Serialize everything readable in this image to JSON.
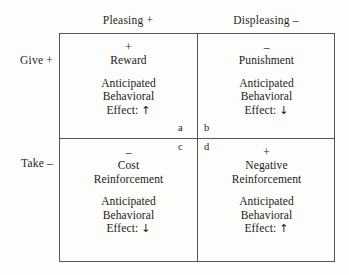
{
  "figure": {
    "column_headers": [
      {
        "id": "pleasing",
        "label": "Pleasing  +"
      },
      {
        "id": "displeasing",
        "label": "Displeasing  –"
      }
    ],
    "row_headers": [
      {
        "id": "give",
        "label": "Give  +"
      },
      {
        "id": "take",
        "label": "Take  –"
      }
    ],
    "effect_prefix": "Anticipated",
    "effect_middle": "Behavioral",
    "cells": [
      {
        "key": "a",
        "sign": "+",
        "title": "Reward",
        "effect_line1": "Anticipated",
        "effect_line2": "Behavioral",
        "effect_line3": "Effect:",
        "effect_arrow": "↑",
        "letter": "a"
      },
      {
        "key": "b",
        "sign": "–",
        "title": "Punishment",
        "effect_line1": "Anticipated",
        "effect_line2": "Behavioral",
        "effect_line3": "Effect:",
        "effect_arrow": "↓",
        "letter": "b"
      },
      {
        "key": "c",
        "sign": "–",
        "title": "Cost\nReinforcement",
        "title_line1": "Cost",
        "title_line2": "Reinforcement",
        "effect_line1": "Anticipated",
        "effect_line2": "Behavioral",
        "effect_line3": "Effect:",
        "effect_arrow": "↓",
        "letter": "c"
      },
      {
        "key": "d",
        "sign": "+",
        "title": "Negative\nReinforcement",
        "title_line1": "Negative",
        "title_line2": "Reinforcement",
        "effect_line1": "Anticipated",
        "effect_line2": "Behavioral",
        "effect_line3": "Effect:",
        "effect_arrow": "↑",
        "letter": "d"
      }
    ],
    "colors": {
      "border": "#54565a",
      "text": "#1f1f1f",
      "background": "#fdfdfc"
    }
  }
}
